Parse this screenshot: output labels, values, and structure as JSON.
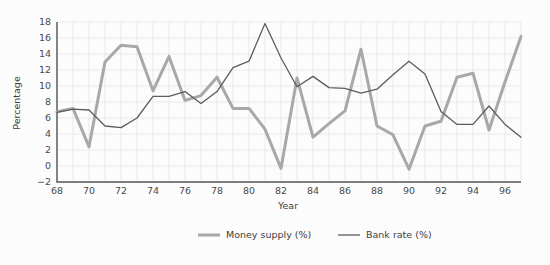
{
  "chart_data": {
    "type": "line",
    "title": "",
    "xlabel": "Year",
    "ylabel": "Percentage",
    "xlim": [
      68,
      97
    ],
    "ylim": [
      -2,
      18
    ],
    "grid": true,
    "legend_position": "bottom",
    "x": [
      68,
      69,
      70,
      71,
      72,
      73,
      74,
      75,
      76,
      77,
      78,
      79,
      80,
      81,
      82,
      83,
      84,
      85,
      86,
      87,
      88,
      89,
      90,
      91,
      92,
      93,
      94,
      95,
      96,
      97
    ],
    "xticks": [
      68,
      70,
      72,
      74,
      76,
      78,
      80,
      82,
      84,
      86,
      88,
      90,
      92,
      94,
      96
    ],
    "xticklabels": [
      "68",
      "70",
      "72",
      "74",
      "76",
      "78",
      "80",
      "82",
      "84",
      "86",
      "88",
      "90",
      "92",
      "94",
      "96"
    ],
    "yticks": [
      -2,
      0,
      2,
      4,
      6,
      8,
      10,
      12,
      14,
      16,
      18
    ],
    "yticklabels": [
      "−2",
      "0",
      "2",
      "4",
      "6",
      "8",
      "10",
      "12",
      "14",
      "16",
      "18"
    ],
    "series": [
      {
        "name": "Money supply (%)",
        "color": "#a8a8a8",
        "linewidth": 3.0,
        "values": [
          6.8,
          7.2,
          2.4,
          13.0,
          15.1,
          14.9,
          9.4,
          13.7,
          8.2,
          8.8,
          11.1,
          7.2,
          7.2,
          4.6,
          -0.3,
          11.0,
          3.6,
          5.3,
          6.9,
          14.6,
          5.0,
          3.9,
          -0.4,
          5.0,
          5.6,
          11.1,
          11.6,
          4.5,
          10.5,
          16.2
        ]
      },
      {
        "name": "Bank rate (%)",
        "color": "#5c5c60",
        "linewidth": 1.3,
        "values": [
          6.7,
          7.1,
          7.0,
          5.0,
          4.8,
          6.0,
          8.7,
          8.7,
          9.3,
          7.8,
          9.3,
          12.3,
          13.1,
          17.8,
          13.5,
          9.9,
          11.2,
          9.8,
          9.7,
          9.1,
          9.6,
          11.4,
          13.1,
          11.5,
          6.8,
          5.2,
          5.2,
          7.5,
          5.2,
          3.6
        ]
      }
    ]
  },
  "legend": {
    "items": [
      {
        "label": "Money supply (%)",
        "color": "#a8a8a8",
        "linewidth": 3.0
      },
      {
        "label": "Bank rate (%)",
        "color": "#5c5c60",
        "linewidth": 1.3
      }
    ]
  }
}
